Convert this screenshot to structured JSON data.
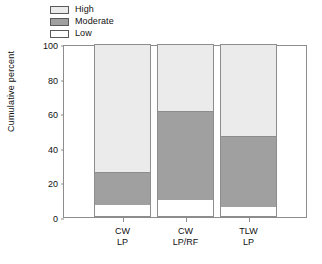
{
  "chart_data": {
    "type": "bar",
    "subtype": "stacked-bar",
    "title": "",
    "xlabel": "",
    "ylabel": "Cumulative percent",
    "ylim": [
      0,
      100
    ],
    "yticks": [
      0,
      20,
      40,
      60,
      80,
      100
    ],
    "grid": false,
    "legend_position": "top-left",
    "categories": [
      "CW\nLP",
      "CW\nLP/RF",
      "TLW\nLP"
    ],
    "category_lines": [
      [
        "CW",
        "LP"
      ],
      [
        "CW",
        "LP/RF"
      ],
      [
        "TLW",
        "LP"
      ]
    ],
    "series": [
      {
        "name": "Low",
        "color": "#ffffff",
        "values": [
          7,
          10,
          6
        ]
      },
      {
        "name": "Moderate",
        "color": "#a0a0a0",
        "values": [
          19,
          51,
          41
        ]
      },
      {
        "name": "High",
        "color": "#ebebeb",
        "values": [
          74,
          39,
          53
        ]
      }
    ],
    "cumulative_tops": {
      "Low": [
        7,
        10,
        6
      ],
      "Moderate": [
        26,
        61,
        47
      ],
      "High": [
        100,
        100,
        100
      ]
    }
  },
  "legend": {
    "items": [
      {
        "label": "High",
        "color": "#ebebeb"
      },
      {
        "label": "Moderate",
        "color": "#a0a0a0"
      },
      {
        "label": "Low",
        "color": "#ffffff"
      }
    ]
  },
  "axes": {
    "y_title": "Cumulative percent",
    "y_ticks": [
      "0",
      "20",
      "40",
      "60",
      "80",
      "100"
    ],
    "x_ticks": [
      {
        "line1": "CW",
        "line2": "LP"
      },
      {
        "line1": "CW",
        "line2": "LP/RF"
      },
      {
        "line1": "TLW",
        "line2": "LP"
      }
    ]
  }
}
